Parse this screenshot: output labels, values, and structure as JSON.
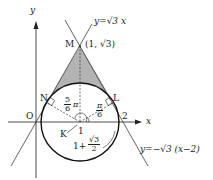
{
  "diagram": {
    "axes": {
      "x_label": "x",
      "y_label": "y",
      "origin_label": "O"
    },
    "lines": [
      {
        "name": "line-1",
        "equation": "y=√3 x"
      },
      {
        "name": "line-2",
        "equation": "y=−√3 (x−2)"
      }
    ],
    "points": {
      "M": {
        "label": "M",
        "coords": "(1, √3)"
      },
      "N": {
        "label": "N"
      },
      "L": {
        "label": "L"
      },
      "K": {
        "label": "K"
      },
      "O": {
        "label": "O"
      }
    },
    "tick_labels": {
      "x1": "1",
      "x2": "2"
    },
    "angles": {
      "angle_N": {
        "num": "5",
        "den": "6",
        "suffix": "π"
      },
      "angle_L": {
        "num": "π",
        "den": "6"
      }
    },
    "annotation": {
      "prefix": "1+",
      "num": "√3",
      "den": "2"
    },
    "colors": {
      "shaded": "#b3b3b3",
      "stroke": "#222222"
    }
  }
}
